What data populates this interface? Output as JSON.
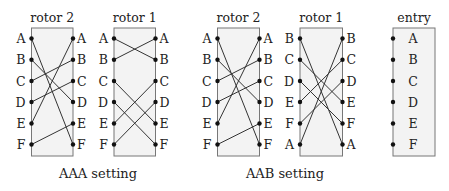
{
  "diagram": {
    "pin_y": [
      38.5,
      59.7,
      81,
      102,
      123.5,
      144.5
    ],
    "box_top": 28,
    "box_bottom": 156,
    "components": [
      {
        "id": "aaa-rotor2",
        "title": "rotor 2",
        "box_left": 31.5,
        "box_right": 73,
        "left_labels": [
          "A",
          "B",
          "C",
          "D",
          "E",
          "F"
        ],
        "right_labels": [
          "A",
          "B",
          "C",
          "D",
          "E",
          "F"
        ],
        "wiring": [
          5,
          3,
          1,
          2,
          0,
          4
        ]
      },
      {
        "id": "aaa-rotor1",
        "title": "rotor 1",
        "box_left": 114,
        "box_right": 155.5,
        "left_labels": [
          "A",
          "B",
          "C",
          "D",
          "E",
          "F"
        ],
        "right_labels": [
          "A",
          "B",
          "C",
          "D",
          "E",
          "F"
        ],
        "wiring": [
          1,
          0,
          4,
          5,
          2,
          3
        ]
      },
      {
        "id": "aab-rotor2",
        "title": "rotor 2",
        "box_left": 217.5,
        "box_right": 259.5,
        "left_labels": [
          "A",
          "B",
          "C",
          "D",
          "E",
          "F"
        ],
        "right_labels": [
          "A",
          "B",
          "C",
          "D",
          "E",
          "F"
        ],
        "wiring": [
          5,
          3,
          1,
          2,
          0,
          4
        ]
      },
      {
        "id": "aab-rotor1",
        "title": "rotor 1",
        "box_left": 300,
        "box_right": 342.5,
        "left_labels": [
          "B",
          "C",
          "D",
          "E",
          "F",
          "A"
        ],
        "right_labels": [
          "B",
          "C",
          "D",
          "E",
          "F",
          "A"
        ],
        "wiring": [
          5,
          3,
          4,
          1,
          2,
          0
        ]
      },
      {
        "id": "entry",
        "title": "entry",
        "box_left": 393,
        "box_right": 435,
        "inner_labels": [
          "A",
          "B",
          "C",
          "D",
          "E",
          "F"
        ]
      }
    ],
    "captions": [
      {
        "id": "aaa-caption",
        "text": "AAA setting",
        "x": 98
      },
      {
        "id": "aab-caption",
        "text": "AAB setting",
        "x": 285
      }
    ]
  }
}
